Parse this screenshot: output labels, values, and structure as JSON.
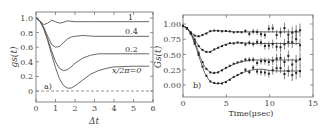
{
  "chart_data": [
    {
      "type": "line",
      "panel_label": "a)",
      "xlabel": "Δt",
      "ylabel": "gs(t)",
      "right_ylabel": "Gs(t)",
      "xlim": [
        0,
        6
      ],
      "ylim": [
        -0.08,
        1.08
      ],
      "xticks": [
        "0",
        "1",
        "2",
        "3",
        "4",
        "5",
        "6"
      ],
      "yticks": [
        "0",
        "0.2",
        "0.4",
        "0.6",
        "0.8",
        "1.0"
      ],
      "series": [
        {
          "name": "1",
          "x": [
            0,
            0.2,
            0.4,
            0.6,
            0.8,
            1.0,
            1.2,
            1.4,
            1.6,
            2.0,
            3,
            4,
            5,
            5.8
          ],
          "values": [
            1.0,
            0.96,
            0.91,
            0.93,
            0.97,
            0.95,
            0.93,
            0.94,
            0.96,
            0.95,
            0.95,
            0.95,
            0.95,
            0.95
          ]
        },
        {
          "name": "0.4",
          "x": [
            0,
            0.2,
            0.4,
            0.6,
            0.8,
            1.0,
            1.2,
            1.4,
            1.6,
            1.8,
            2.0,
            2.4,
            3,
            4,
            5,
            5.8
          ],
          "values": [
            1.0,
            0.96,
            0.87,
            0.75,
            0.64,
            0.6,
            0.61,
            0.66,
            0.71,
            0.74,
            0.75,
            0.76,
            0.75,
            0.75,
            0.75,
            0.75
          ]
        },
        {
          "name": "0.2",
          "x": [
            0,
            0.2,
            0.4,
            0.6,
            0.8,
            1.0,
            1.2,
            1.4,
            1.6,
            1.8,
            2.0,
            2.4,
            2.8,
            3.2,
            4,
            5,
            5.8
          ],
          "values": [
            1.0,
            0.96,
            0.86,
            0.71,
            0.55,
            0.4,
            0.31,
            0.28,
            0.29,
            0.33,
            0.38,
            0.45,
            0.49,
            0.51,
            0.51,
            0.51,
            0.51
          ]
        },
        {
          "name": "x/2π=0",
          "x": [
            0,
            0.2,
            0.4,
            0.6,
            0.8,
            1.0,
            1.2,
            1.4,
            1.6,
            1.8,
            2.0,
            2.4,
            2.8,
            3.2,
            3.6,
            4,
            5,
            5.8
          ],
          "values": [
            1.0,
            0.96,
            0.85,
            0.69,
            0.5,
            0.32,
            0.17,
            0.08,
            0.04,
            0.04,
            0.07,
            0.15,
            0.23,
            0.28,
            0.31,
            0.33,
            0.34,
            0.34
          ]
        },
        {
          "name": "zero-line",
          "style": "dashed",
          "x": [
            0,
            6
          ],
          "values": [
            0,
            0
          ]
        }
      ],
      "annotations": [
        "1",
        "0.4",
        "0.2",
        "x/2π=0",
        "a)"
      ]
    },
    {
      "type": "scatter",
      "panel_label": "b)",
      "xlabel": "Time(μsec)",
      "ylabel": "Gs(t)",
      "xlim": [
        0,
        15
      ],
      "ylim": [
        -0.15,
        1.12
      ],
      "xticks": [
        "0",
        "5",
        "10",
        "15"
      ],
      "yticks": [
        "0.00",
        "0.25",
        "0.50",
        "0.75",
        "1.00"
      ],
      "series": [
        {
          "name": "curve-1",
          "x": [
            0,
            0.5,
            1,
            1.5,
            2,
            2.5,
            3,
            3.5,
            4,
            5,
            6,
            7,
            8,
            9,
            10,
            11,
            12,
            13,
            13.5
          ],
          "values": [
            0.97,
            0.93,
            0.85,
            0.8,
            0.8,
            0.84,
            0.87,
            0.89,
            0.89,
            0.88,
            0.87,
            0.87,
            0.87,
            0.87,
            0.87,
            0.87,
            0.87,
            0.87,
            0.87
          ]
        },
        {
          "name": "curve-2",
          "x": [
            0,
            0.5,
            1,
            1.5,
            2,
            2.5,
            3,
            3.5,
            4,
            5,
            6,
            7,
            8,
            9,
            10,
            11,
            12,
            13,
            13.5
          ],
          "values": [
            0.97,
            0.93,
            0.83,
            0.71,
            0.6,
            0.55,
            0.54,
            0.57,
            0.61,
            0.67,
            0.69,
            0.69,
            0.68,
            0.68,
            0.68,
            0.68,
            0.68,
            0.68,
            0.68
          ]
        },
        {
          "name": "curve-3",
          "x": [
            0,
            0.5,
            1,
            1.5,
            2,
            2.5,
            3,
            3.5,
            4,
            5,
            6,
            7,
            8,
            9,
            10,
            11,
            12,
            13,
            13.5
          ],
          "values": [
            0.97,
            0.93,
            0.82,
            0.65,
            0.45,
            0.3,
            0.22,
            0.19,
            0.21,
            0.28,
            0.35,
            0.39,
            0.41,
            0.41,
            0.41,
            0.41,
            0.41,
            0.41,
            0.41
          ]
        },
        {
          "name": "curve-4",
          "x": [
            0,
            0.5,
            1,
            1.5,
            2,
            2.5,
            3,
            3.5,
            4,
            4.5,
            5,
            6,
            7,
            8,
            9,
            10,
            11,
            12,
            13,
            13.5
          ],
          "values": [
            0.97,
            0.93,
            0.81,
            0.62,
            0.4,
            0.2,
            0.08,
            0.03,
            0.02,
            0.03,
            0.06,
            0.14,
            0.21,
            0.25,
            0.26,
            0.24,
            0.23,
            0.23,
            0.23,
            0.23
          ]
        }
      ],
      "annotations": [
        "b)"
      ]
    }
  ]
}
